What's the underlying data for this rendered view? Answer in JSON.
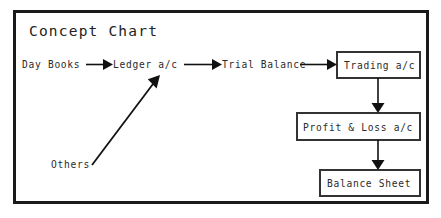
{
  "diagram": {
    "title": "Concept Chart",
    "type": "flowchart",
    "frame": {
      "border_color": "#1a1a1a",
      "background": "#ffffff"
    },
    "plain_nodes": [
      {
        "id": "day-books",
        "label": "Day Books",
        "x": 22,
        "y": 68
      },
      {
        "id": "ledger-ac",
        "label": "Ledger a/c",
        "x": 113,
        "y": 68
      },
      {
        "id": "trial-balance",
        "label": "Trial Balance",
        "x": 222,
        "y": 68
      },
      {
        "id": "others",
        "label": "Others",
        "x": 51,
        "y": 168
      }
    ],
    "boxed_nodes": [
      {
        "id": "trading-ac",
        "label": "Trading a/c",
        "x": 337,
        "y": 52,
        "width": 83,
        "height": 26
      },
      {
        "id": "profit-loss-ac",
        "label": "Profit & Loss a/c",
        "x": 297,
        "y": 113,
        "width": 123,
        "height": 27
      },
      {
        "id": "balance-sheet",
        "label": "Balance Sheet",
        "x": 320,
        "y": 170,
        "width": 100,
        "height": 26
      }
    ],
    "connections": [
      {
        "id": "day-books-to-ledger",
        "from": "day-books",
        "to": "ledger-ac",
        "direction": "right"
      },
      {
        "id": "ledger-to-trial-balance",
        "from": "ledger-ac",
        "to": "trial-balance",
        "direction": "right"
      },
      {
        "id": "trial-balance-to-trading",
        "from": "trial-balance",
        "to": "trading-ac",
        "direction": "right"
      },
      {
        "id": "others-to-ledger",
        "from": "others",
        "to": "ledger-ac",
        "direction": "diagonal-up-right"
      },
      {
        "id": "trading-to-profit-loss",
        "from": "trading-ac",
        "to": "profit-loss-ac",
        "direction": "down"
      },
      {
        "id": "profit-loss-to-balance-sheet",
        "from": "profit-loss-ac",
        "to": "balance-sheet",
        "direction": "down"
      }
    ]
  }
}
